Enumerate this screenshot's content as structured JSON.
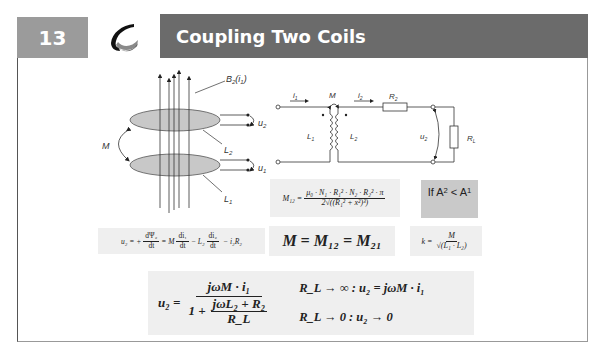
{
  "header": {
    "slide_number": "13",
    "title": "Coupling Two Coils",
    "logo": "swirl-logo-icon"
  },
  "colors": {
    "number_box": "#9b9b9b",
    "title_bar": "#6b6b6b",
    "formula_box": "#efefef",
    "condition_box": "#c9c9c9"
  },
  "coil_diagram": {
    "field_label": "B2(i1)",
    "field_label_main": "B",
    "field_label_sub": "2",
    "field_label_arg": "(i",
    "field_label_arg_sub": "1",
    "field_label_close": ")",
    "mutual_label": "M",
    "coil2_label": "L",
    "coil2_sub": "2",
    "coil1_label": "L",
    "coil1_sub": "1",
    "u2_label": "u",
    "u2_sub": "2",
    "u1_label": "u",
    "u1_sub": "1"
  },
  "circuit_diagram": {
    "i1_label": "i",
    "i1_sub": "1",
    "i2_label": "i",
    "i2_sub": "2",
    "m_label": "M",
    "r2_label": "R",
    "r2_sub": "2",
    "l1_label": "L",
    "l1_sub": "1",
    "l2_label": "L",
    "l2_sub": "2",
    "u2_label": "u",
    "u2_sub": "2",
    "rl_label": "R",
    "rl_sub": "L"
  },
  "formulas": {
    "m12": {
      "lhs": "M₁₂ =",
      "numerator": "μ₀ · N₁ · R₁² · N₂ · R₂² · π",
      "denominator": "2√((R₁² + x²)³)"
    },
    "condition": {
      "text_if": "If A",
      "a2_sub": "2",
      "lt": " < A",
      "a1_sub": "1"
    },
    "u2_induction": {
      "lhs": "u₂ = +",
      "frac1_num": "dΨ₂",
      "frac1_den": "dt",
      "eq": "= M",
      "frac2_num": "di₁",
      "frac2_den": "dt",
      "minus_l2": "− L₂",
      "frac3_num": "di₂",
      "frac3_den": "dt",
      "tail": "− i₂R₂"
    },
    "mutual_equal": "M = M₁₂ = M₂₁",
    "coupling_factor": {
      "lhs": "k =",
      "numerator": "M",
      "denominator": "√(L₁ · L₂)"
    },
    "u2_load": {
      "lhs": "u₂ =",
      "numerator": "jωM · i₁",
      "den_prefix": "1 +",
      "inner_num": "jωL₂ + R₂",
      "inner_den": "R_L",
      "case1": "R_L → ∞ : u₂ = jωM · i₁",
      "case2": "R_L → 0 : u₂ → 0"
    }
  }
}
